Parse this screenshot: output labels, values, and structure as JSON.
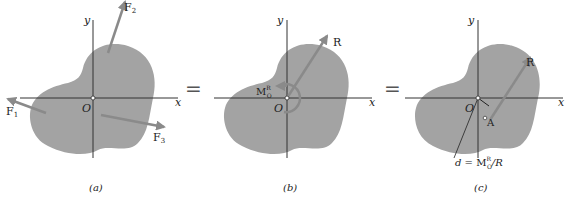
{
  "colors": {
    "body_fill": "#a3a3a3",
    "arrow": "#8a8a8a",
    "axis": "#333333",
    "text": "#222222"
  },
  "panels": [
    {
      "caption": "(a)",
      "axis_x": "x",
      "axis_y": "y",
      "origin": "O",
      "forces": [
        {
          "label": "F",
          "sub": "1"
        },
        {
          "label": "F",
          "sub": "2"
        },
        {
          "label": "F",
          "sub": "3"
        }
      ]
    },
    {
      "caption": "(b)",
      "axis_x": "x",
      "axis_y": "y",
      "origin": "O",
      "resultant": "R",
      "moment": {
        "label": "M",
        "sub": "O",
        "sup": "R"
      }
    },
    {
      "caption": "(c)",
      "axis_x": "x",
      "axis_y": "y",
      "origin": "O",
      "resultant": "R",
      "point": "A",
      "distance_formula": {
        "d": "d",
        "eq": " = M",
        "sub": "O",
        "sup": "R",
        "tail": "/R"
      }
    }
  ],
  "equals": [
    "=",
    "="
  ]
}
